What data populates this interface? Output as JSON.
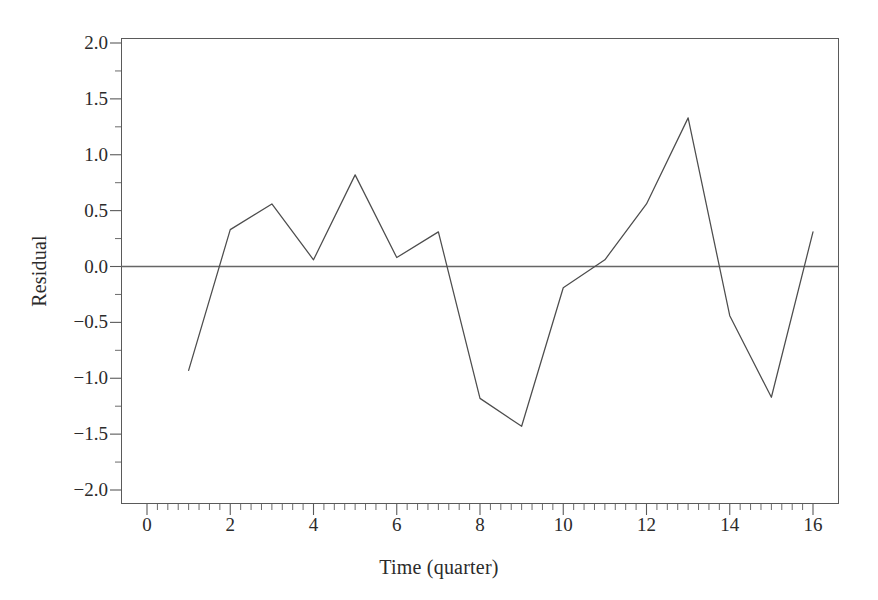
{
  "chart_data": {
    "type": "line",
    "title": "",
    "xlabel": "Time (quarter)",
    "ylabel": "Residual",
    "xlim": [
      -0.63,
      16.63
    ],
    "ylim": [
      -2.2,
      2.2
    ],
    "grid": false,
    "legend": null,
    "x": [
      1,
      2,
      3,
      4,
      5,
      6,
      7,
      8,
      9,
      10,
      11,
      12,
      13,
      14,
      15,
      16
    ],
    "values": [
      -0.93,
      0.33,
      0.56,
      0.06,
      0.82,
      0.08,
      0.31,
      -1.18,
      -1.43,
      -0.19,
      0.06,
      0.56,
      1.33,
      -0.44,
      -1.17,
      0.31
    ],
    "series": [
      {
        "name": "Residual",
        "values": [
          -0.93,
          0.33,
          0.56,
          0.06,
          0.82,
          0.08,
          0.31,
          -1.18,
          -1.43,
          -0.19,
          0.06,
          0.56,
          1.33,
          -0.44,
          -1.17,
          0.31
        ]
      }
    ],
    "reference_lines": [
      {
        "axis": "y",
        "value": 0.0
      }
    ],
    "xticks": [
      0,
      2,
      4,
      6,
      8,
      10,
      12,
      14,
      16
    ],
    "xtick_labels": [
      "0",
      "2",
      "4",
      "6",
      "8",
      "10",
      "12",
      "14",
      "16"
    ],
    "xminor_interval": 0.25,
    "yticks": [
      -2.0,
      -1.5,
      -1.0,
      -0.5,
      0.0,
      0.5,
      1.0,
      1.5,
      2.0
    ],
    "ytick_labels": [
      "−2.0",
      "−1.5",
      "−1.0",
      "−0.5",
      "0.0",
      "0.5",
      "1.0",
      "1.5",
      "2.0"
    ],
    "yminor_interval": 0.25
  },
  "style": {
    "line_color": "#4d4d4d",
    "frame_color": "#5a5a5a",
    "zero_line_color": "#666666",
    "text_color": "#2b2b2b",
    "background": "#ffffff"
  }
}
